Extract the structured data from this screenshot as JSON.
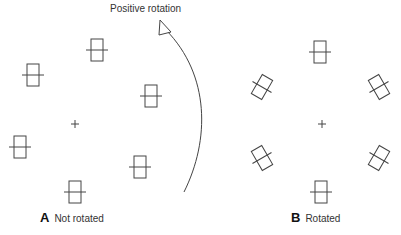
{
  "arrow_label": "Positive rotation",
  "panels": [
    {
      "letter": "A",
      "caption": "Not rotated"
    },
    {
      "letter": "B",
      "caption": "Rotated"
    }
  ],
  "stroke_color": "#444444",
  "panel_a": {
    "center": [
      75,
      124
    ],
    "elements": [
      {
        "x": 97,
        "y": 50,
        "angle": 0
      },
      {
        "x": 33,
        "y": 75,
        "angle": 0
      },
      {
        "x": 151,
        "y": 96,
        "angle": 0
      },
      {
        "x": 20,
        "y": 147,
        "angle": 0
      },
      {
        "x": 140,
        "y": 167,
        "angle": 0
      },
      {
        "x": 75,
        "y": 192,
        "angle": 0
      }
    ]
  },
  "panel_b": {
    "center": [
      322,
      124
    ],
    "elements": [
      {
        "x": 320,
        "y": 52,
        "angle": 0
      },
      {
        "x": 262,
        "y": 87,
        "angle": 30
      },
      {
        "x": 379,
        "y": 87,
        "angle": -30
      },
      {
        "x": 262,
        "y": 158,
        "angle": -30
      },
      {
        "x": 379,
        "y": 158,
        "angle": 30
      },
      {
        "x": 321,
        "y": 192,
        "angle": 0
      }
    ]
  }
}
